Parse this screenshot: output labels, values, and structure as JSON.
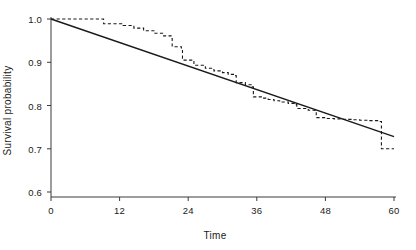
{
  "chart_data": {
    "type": "line",
    "title": "",
    "xlabel": "Time",
    "ylabel": "Survival probability",
    "xlim": [
      0,
      60
    ],
    "ylim": [
      0.6,
      1.0
    ],
    "xticks": [
      0,
      12,
      24,
      36,
      48,
      60
    ],
    "xtick_labels": [
      "0",
      "12",
      "24",
      "36",
      "48",
      "60"
    ],
    "yticks": [
      0.6,
      0.7,
      0.8,
      0.9,
      1.0
    ],
    "ytick_labels": [
      "0.6",
      "0.7",
      "0.8",
      "0.9",
      "1.0"
    ],
    "grid": false,
    "legend": null,
    "line_color": "#1a1a1a",
    "background_color": "#ffffff",
    "series": [
      {
        "name": "Kaplan-Meier estimate",
        "style": "dashed-step",
        "x": [
          0,
          9.1,
          9.2,
          12.6,
          14.5,
          16.2,
          18.0,
          19.7,
          21.0,
          21.2,
          22.8,
          23.0,
          25.0,
          27.0,
          28.5,
          30.0,
          31.0,
          32.2,
          32.4,
          34.0,
          35.2,
          35.4,
          36.8,
          38.0,
          39.0,
          40.0,
          41.5,
          42.8,
          43.0,
          45.0,
          46.2,
          46.4,
          48.0,
          49.5,
          51.0,
          52.5,
          54.0,
          55.5,
          57.6,
          57.8,
          60.0
        ],
        "y": [
          1.0,
          1.0,
          0.989,
          0.985,
          0.979,
          0.973,
          0.967,
          0.961,
          0.955,
          0.936,
          0.933,
          0.905,
          0.893,
          0.886,
          0.88,
          0.876,
          0.872,
          0.869,
          0.853,
          0.848,
          0.843,
          0.82,
          0.817,
          0.814,
          0.811,
          0.808,
          0.805,
          0.802,
          0.793,
          0.789,
          0.786,
          0.772,
          0.77,
          0.769,
          0.768,
          0.767,
          0.766,
          0.765,
          0.763,
          0.7,
          0.7
        ]
      },
      {
        "name": "Fitted exponential model",
        "style": "solid",
        "x": [
          0,
          60
        ],
        "y": [
          1.0,
          0.728
        ]
      }
    ]
  },
  "axes": {
    "x_title": "Time",
    "y_title": "Survival probability",
    "x_tick_labels": [
      "0",
      "12",
      "24",
      "36",
      "48",
      "60"
    ],
    "y_tick_labels": [
      "1.0",
      "0.9",
      "0.8",
      "0.7",
      "0.6"
    ]
  }
}
